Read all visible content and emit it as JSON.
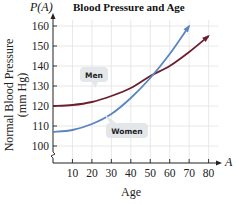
{
  "chart_data": {
    "type": "line",
    "title": "Blood Pressure and Age",
    "function_label": "P(A)",
    "xlabel": "Age",
    "x_axis_symbol": "A",
    "ylabel_line1": "Normal Blood Pressure",
    "ylabel_line2": "(mm Hg)",
    "xlim": [
      0,
      85
    ],
    "ylim": [
      95,
      165
    ],
    "x_ticks": [
      10,
      20,
      30,
      40,
      50,
      60,
      70,
      80
    ],
    "x_tick_labels": [
      "10",
      "20",
      "30",
      "40",
      "50",
      "60",
      "70",
      "80"
    ],
    "y_ticks": [
      100,
      110,
      120,
      130,
      140,
      150,
      160
    ],
    "y_tick_labels": [
      "100",
      "110",
      "120",
      "130",
      "140",
      "150",
      "160"
    ],
    "grid": true,
    "axis_break": true,
    "series": [
      {
        "name": "Men",
        "color": "#6b1f2e",
        "x": [
          0,
          10,
          20,
          30,
          40,
          50,
          60,
          70,
          80
        ],
        "values": [
          120,
          120.5,
          122,
          125,
          129,
          135,
          140,
          147,
          155
        ]
      },
      {
        "name": "Women",
        "color": "#5a86c0",
        "x": [
          0,
          10,
          20,
          30,
          40,
          50,
          60,
          70
        ],
        "values": [
          107,
          108,
          111,
          116,
          124,
          134,
          146,
          160
        ]
      }
    ],
    "annotations": [
      {
        "text": "Men",
        "series": "Men"
      },
      {
        "text": "Women",
        "series": "Women"
      }
    ]
  }
}
